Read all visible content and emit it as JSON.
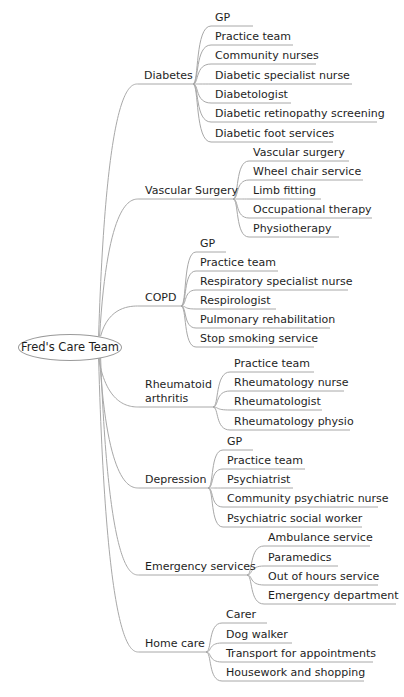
{
  "diagram": {
    "type": "mind-map",
    "line_color": "#a8a8a8",
    "root": {
      "label": "Fred's Care Team",
      "cx": 70,
      "cy": 347,
      "rx": 52,
      "ry": 13.5
    },
    "branches": [
      {
        "label": "Diabetes",
        "lines": [
          "Diabetes"
        ],
        "x": 144,
        "y": 84,
        "end": 193,
        "child_x": 215,
        "children": [
          {
            "label": "GP",
            "y": 26,
            "w": 32
          },
          {
            "label": "Practice team",
            "y": 45,
            "w": 72
          },
          {
            "label": "Community nurses",
            "y": 64,
            "w": 95
          },
          {
            "label": "Diabetic specialist nurse",
            "y": 84,
            "w": 131
          },
          {
            "label": "Diabetologist",
            "y": 103,
            "w": 70
          },
          {
            "label": "Diabetic retinopathy screening",
            "y": 122,
            "w": 156
          },
          {
            "label": "Diabetic foot services",
            "y": 142,
            "w": 112
          }
        ]
      },
      {
        "label": "Vascular Surgery",
        "lines": [
          "Vascular Surgery"
        ],
        "x": 145,
        "y": 199,
        "end": 233,
        "child_x": 253,
        "children": [
          {
            "label": "Vascular surgery",
            "y": 161,
            "w": 90
          },
          {
            "label": "Wheel chair service",
            "y": 180,
            "w": 104
          },
          {
            "label": "Limb fitting",
            "y": 199,
            "w": 62
          },
          {
            "label": "Occupational therapy",
            "y": 218,
            "w": 113
          },
          {
            "label": "Physiotherapy",
            "y": 237,
            "w": 80
          }
        ]
      },
      {
        "label": "COPD",
        "lines": [
          "COPD"
        ],
        "x": 145,
        "y": 306,
        "end": 181,
        "child_x": 200,
        "children": [
          {
            "label": "GP",
            "y": 252,
            "w": 20
          },
          {
            "label": "Practice team",
            "y": 271,
            "w": 72
          },
          {
            "label": "Respiratory specialist nurse",
            "y": 290,
            "w": 142
          },
          {
            "label": "Respirologist",
            "y": 309,
            "w": 70
          },
          {
            "label": "Pulmonary rehabilitation",
            "y": 328,
            "w": 124
          },
          {
            "label": "Stop smoking service",
            "y": 347,
            "w": 108
          }
        ]
      },
      {
        "label": "Rheumatoid arthritis",
        "lines": [
          "Rheumatoid",
          "arthritis"
        ],
        "x": 145,
        "y": 407,
        "end": 213,
        "child_x": 234,
        "children": [
          {
            "label": "Practice team",
            "y": 372,
            "w": 74
          },
          {
            "label": "Rheumatology nurse",
            "y": 391,
            "w": 104
          },
          {
            "label": "Rheumatologist",
            "y": 410,
            "w": 82
          },
          {
            "label": "Rheumatology physio",
            "y": 430,
            "w": 110
          }
        ]
      },
      {
        "label": "Depression",
        "lines": [
          "Depression"
        ],
        "x": 145,
        "y": 488,
        "end": 208,
        "child_x": 227,
        "children": [
          {
            "label": "GP",
            "y": 450,
            "w": 20
          },
          {
            "label": "Practice team",
            "y": 469,
            "w": 72
          },
          {
            "label": "Psychiatrist",
            "y": 488,
            "w": 60
          },
          {
            "label": "Community psychiatric nurse",
            "y": 507,
            "w": 145
          },
          {
            "label": "Psychiatric social worker",
            "y": 527,
            "w": 129
          }
        ]
      },
      {
        "label": "Emergency services",
        "lines": [
          "Emergency services"
        ],
        "x": 145,
        "y": 575,
        "end": 247,
        "child_x": 268,
        "children": [
          {
            "label": "Ambulance service",
            "y": 546,
            "w": 96
          },
          {
            "label": "Paramedics",
            "y": 566,
            "w": 64
          },
          {
            "label": "Out of hours service",
            "y": 585,
            "w": 104
          },
          {
            "label": "Emergency department",
            "y": 604,
            "w": 122
          }
        ]
      },
      {
        "label": "Home care",
        "lines": [
          "Home care"
        ],
        "x": 145,
        "y": 652,
        "end": 206,
        "child_x": 226,
        "children": [
          {
            "label": "Carer",
            "y": 623,
            "w": 35
          },
          {
            "label": "Dog walker",
            "y": 643,
            "w": 60
          },
          {
            "label": "Transport for appointments",
            "y": 662,
            "w": 141
          },
          {
            "label": "Housework and shopping",
            "y": 681,
            "w": 132
          }
        ]
      }
    ]
  }
}
